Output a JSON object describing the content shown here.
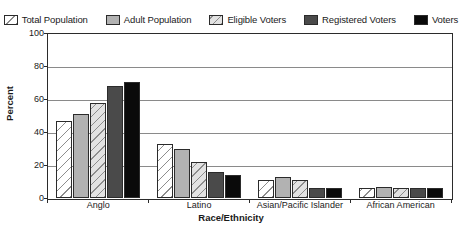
{
  "chart_data": {
    "type": "bar",
    "title": "",
    "xlabel": "Race/Ethnicity",
    "ylabel": "Percent",
    "ylim": [
      0,
      100
    ],
    "yticks": [
      0,
      20,
      40,
      60,
      80,
      100
    ],
    "grid": true,
    "legend_position": "top",
    "categories": [
      "Anglo",
      "Latino",
      "Asian/Pacific Islander",
      "African American"
    ],
    "series": [
      {
        "name": "Total Population",
        "swatch": "white-diagonal-hatch",
        "color": "#ffffff",
        "values": [
          47,
          33,
          11,
          6
        ]
      },
      {
        "name": "Adult Population",
        "swatch": "medium-gray-solid",
        "color": "#b2b2b2",
        "values": [
          51,
          30,
          13,
          7
        ]
      },
      {
        "name": "Eligible Voters",
        "swatch": "light-gray-diagonal-hatch",
        "color": "#e2e2e2",
        "values": [
          58,
          22,
          11,
          6
        ]
      },
      {
        "name": "Registered Voters",
        "swatch": "dark-gray-solid",
        "color": "#4a4a4a",
        "values": [
          68,
          16,
          6,
          6
        ]
      },
      {
        "name": "Voters",
        "swatch": "black-solid",
        "color": "#0a0a0a",
        "values": [
          71,
          14,
          6,
          6
        ]
      }
    ]
  },
  "axis": {
    "y_tick_labels": [
      "100",
      "80",
      "60",
      "40",
      "20",
      "0"
    ],
    "y_title": "Percent",
    "x_tick_labels": [
      "Anglo",
      "Latino",
      "Asian/Pacific Islander",
      "African American"
    ],
    "x_title": "Race/Ethnicity"
  },
  "legend": {
    "items": [
      {
        "label": "Total Population",
        "fill_class": "fill-total"
      },
      {
        "label": "Adult Population",
        "fill_class": "fill-adult"
      },
      {
        "label": "Eligible Voters",
        "fill_class": "fill-eligible"
      },
      {
        "label": "Registered Voters",
        "fill_class": "fill-registered"
      },
      {
        "label": "Voters",
        "fill_class": "fill-voters"
      }
    ]
  }
}
